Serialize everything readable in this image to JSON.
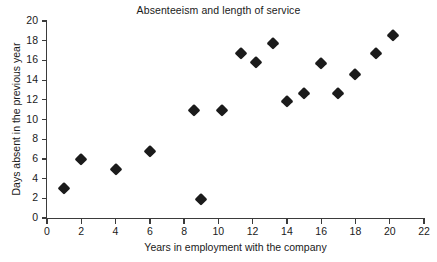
{
  "chart_data": {
    "type": "scatter",
    "title": "Absenteeism and length of service",
    "xlabel": "Years in employment with the company",
    "ylabel": "Days absent in the previous year",
    "xlim": [
      0,
      22
    ],
    "ylim": [
      0,
      20
    ],
    "xticks": [
      0,
      2,
      4,
      6,
      8,
      10,
      12,
      14,
      16,
      18,
      20,
      22
    ],
    "yticks": [
      0,
      2,
      4,
      6,
      8,
      10,
      12,
      14,
      16,
      18,
      20
    ],
    "grid": false,
    "legend": null,
    "marker_shape": "diamond",
    "marker_color": "#1b1b1b",
    "points": [
      {
        "x": 1,
        "y": 3
      },
      {
        "x": 2,
        "y": 6
      },
      {
        "x": 4,
        "y": 5
      },
      {
        "x": 6,
        "y": 6.8
      },
      {
        "x": 8.6,
        "y": 11
      },
      {
        "x": 9,
        "y": 1.9
      },
      {
        "x": 10.2,
        "y": 11
      },
      {
        "x": 11.3,
        "y": 16.8
      },
      {
        "x": 12.2,
        "y": 15.8
      },
      {
        "x": 13.2,
        "y": 17.8
      },
      {
        "x": 14,
        "y": 11.9
      },
      {
        "x": 15,
        "y": 12.7
      },
      {
        "x": 16,
        "y": 15.7
      },
      {
        "x": 17,
        "y": 12.7
      },
      {
        "x": 18,
        "y": 14.6
      },
      {
        "x": 19.2,
        "y": 16.8
      },
      {
        "x": 20.2,
        "y": 18.6
      }
    ]
  }
}
